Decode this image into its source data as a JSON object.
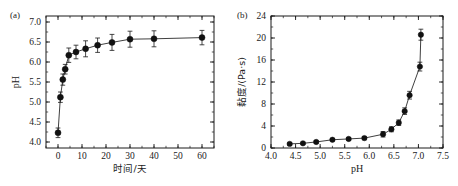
{
  "figure": {
    "width": 458,
    "height": 186,
    "background": "#ffffff",
    "ink_color": "#1a1a1a",
    "marker_color": "#111111"
  },
  "panels": [
    {
      "id": "a",
      "label": "(a)"
    },
    {
      "id": "b",
      "label": "(b)"
    }
  ],
  "chart_data": [
    {
      "type": "scatter",
      "panel": "(a)",
      "title": "",
      "xlabel": "时间/天",
      "ylabel": "pH",
      "xlim": [
        -5,
        65
      ],
      "ylim": [
        3.85,
        7.15
      ],
      "xticks": [
        0,
        10,
        20,
        30,
        40,
        50,
        60
      ],
      "xtick_labels": [
        "0",
        "10",
        "20",
        "30",
        "40",
        "50",
        "60"
      ],
      "yticks": [
        4.0,
        4.5,
        5.0,
        5.5,
        6.0,
        6.5,
        7.0
      ],
      "ytick_labels": [
        "4.0",
        "4.5",
        "5.0",
        "5.5",
        "6.0",
        "6.5",
        "7.0"
      ],
      "x_minor_step": 5,
      "y_minor_step": 0.25,
      "grid": false,
      "legend": "none",
      "marker": "filled-circle",
      "errorbars": true,
      "x": [
        0,
        1,
        2,
        3,
        4.5,
        7.5,
        11.5,
        16.5,
        22.5,
        30,
        40,
        60
      ],
      "y": [
        4.23,
        5.12,
        5.56,
        5.82,
        6.17,
        6.25,
        6.33,
        6.42,
        6.49,
        6.57,
        6.58,
        6.61
      ],
      "yerr": [
        0.12,
        0.13,
        0.14,
        0.12,
        0.18,
        0.17,
        0.2,
        0.18,
        0.2,
        0.2,
        0.2,
        0.18
      ]
    },
    {
      "type": "scatter",
      "panel": "(b)",
      "title": "",
      "xlabel": "pH",
      "ylabel": "黏度/(Pa·s)",
      "xlim": [
        4.0,
        7.5
      ],
      "ylim": [
        0,
        24
      ],
      "xticks": [
        4.0,
        4.5,
        5.0,
        5.5,
        6.0,
        6.5,
        7.0,
        7.5
      ],
      "xtick_labels": [
        "4.0",
        "4.5",
        "5.0",
        "5.5",
        "6.0",
        "6.5",
        "7.0",
        "7.5"
      ],
      "yticks": [
        0,
        4,
        8,
        12,
        16,
        20,
        24
      ],
      "ytick_labels": [
        "0",
        "4",
        "8",
        "12",
        "16",
        "20",
        "24"
      ],
      "x_minor_step": 0.25,
      "y_minor_step": 2,
      "grid": false,
      "legend": "none",
      "marker": "filled-circle",
      "errorbars": true,
      "x": [
        4.38,
        4.65,
        4.92,
        5.25,
        5.58,
        5.9,
        6.28,
        6.45,
        6.6,
        6.72,
        6.82,
        7.03
      ],
      "y": [
        0.75,
        0.85,
        1.1,
        1.5,
        1.65,
        1.8,
        2.5,
        3.4,
        4.6,
        6.7,
        9.6,
        14.8
      ],
      "yerr": [
        0.2,
        0.2,
        0.2,
        0.2,
        0.25,
        0.3,
        0.5,
        0.45,
        0.5,
        0.6,
        0.7,
        0.8
      ],
      "x_extra": [
        7.05
      ],
      "y_extra": [
        20.6
      ],
      "yerr_extra": [
        1.0
      ]
    }
  ]
}
